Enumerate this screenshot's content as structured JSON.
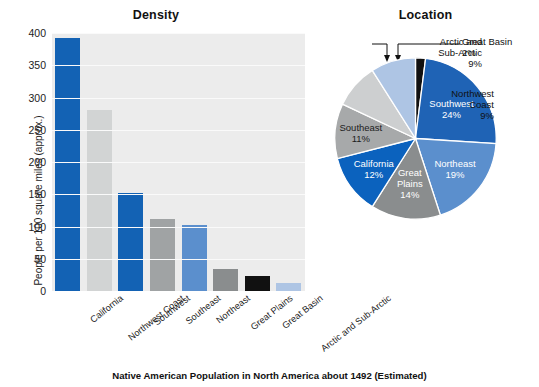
{
  "caption": "Native American Population in North America about 1492 (Estimated)",
  "bar_panel": {
    "title": "Density",
    "ylabel": "People per 100 square miles (approx.)"
  },
  "pie_panel": {
    "title": "Location"
  },
  "chart_data": [
    {
      "type": "bar",
      "title": "Density",
      "xlabel": "",
      "ylabel": "People per 100 square miles (approx.)",
      "ylim": [
        0,
        400
      ],
      "yticks": [
        0,
        50,
        100,
        150,
        200,
        250,
        300,
        350,
        400
      ],
      "grid": true,
      "legend": "none",
      "categories": [
        "California",
        "Northwest Coast",
        "Southwest",
        "Southeast",
        "Northeast",
        "Great Plains",
        "Great Basin",
        "Arctic and Sub-Arctic"
      ],
      "values": [
        393,
        281,
        152,
        112,
        102,
        34,
        24,
        13
      ],
      "colors": [
        "#1362b4",
        "#d2d4d4",
        "#1362b4",
        "#a0a3a4",
        "#5b8fcd",
        "#8a8d8e",
        "#111111",
        "#aec5e4"
      ]
    },
    {
      "type": "pie",
      "title": "Location",
      "start_angle_deg": 0,
      "direction": "clockwise",
      "categories": [
        "Great Basin",
        "Southwest",
        "Northeast",
        "Great Plains",
        "California",
        "Southeast",
        "Northwest Coast",
        "Arctic and Sub-Arctic"
      ],
      "values": [
        2,
        24,
        19,
        14,
        12,
        11,
        9,
        9
      ],
      "value_labels": [
        "2%",
        "24%",
        "19%",
        "14%",
        "12%",
        "11%",
        "9%",
        "9%"
      ],
      "colors": [
        "#111111",
        "#1f63b5",
        "#5b8fcd",
        "#8a8d8e",
        "#0b62be",
        "#a7a9aa",
        "#cdcfd0",
        "#aec5e4"
      ],
      "label_placement": [
        "callout",
        "inside",
        "inside",
        "inside",
        "inside",
        "inside",
        "callout",
        "callout"
      ]
    }
  ],
  "bar_labels": [
    "California",
    "Northwest Coast",
    "Southwest",
    "Southeast",
    "Northeast",
    "Great Plains",
    "Great Basin",
    "Arctic and Sub-Arctic"
  ],
  "y_ticks": [
    "400",
    "350",
    "300",
    "250",
    "200",
    "150",
    "100",
    "50",
    "0"
  ],
  "pie_inside_labels": [
    {
      "name": "Southwest",
      "pct": "24%"
    },
    {
      "name": "Northeast",
      "pct": "19%"
    },
    {
      "name": "Great Plains",
      "pct": "14%",
      "line1": "Great",
      "line2": "Plains"
    },
    {
      "name": "California",
      "pct": "12%"
    },
    {
      "name": "Southeast",
      "pct": "11%"
    }
  ],
  "pie_callouts": [
    {
      "name": "Great Basin",
      "pct": "2%",
      "line1": "Great Basin",
      "line2": "2%"
    },
    {
      "name": "Arctic and Sub-Arctic",
      "pct": "9%",
      "line1": "Arctic and",
      "line2": "Sub-Arctic",
      "line3": "9%"
    },
    {
      "name": "Northwest Coast",
      "pct": "9%",
      "line1": "Northwest",
      "line2": "Coast",
      "line3": "9%"
    }
  ]
}
